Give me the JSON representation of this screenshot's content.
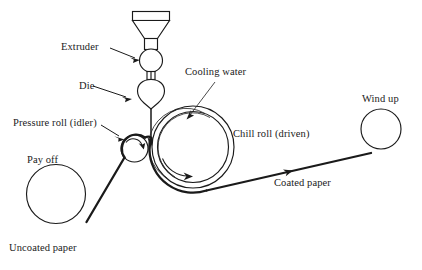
{
  "diagram": {
    "background_color": "#ffffff",
    "line_color": "#1a1a1a",
    "labels": {
      "extruder": "Extruder",
      "die": "Die",
      "pressure_roll": "Pressure roll (idler)",
      "pay_off": "Pay off",
      "uncoated_paper": "Uncoated paper",
      "cooling_water": "Cooling water",
      "chill_roll": "Chill roll (driven)",
      "coated_paper": "Coated paper",
      "wind_up": "Wind up"
    },
    "components": [
      {
        "name": "hopper",
        "shape": "funnel",
        "label": ""
      },
      {
        "name": "extruder-barrel",
        "shape": "circle",
        "label": "Extruder"
      },
      {
        "name": "die",
        "shape": "teardrop",
        "label": "Die"
      },
      {
        "name": "chill-roll",
        "shape": "concentric-circles",
        "label": "Chill roll (driven)",
        "rotation": "clockwise"
      },
      {
        "name": "pressure-roll",
        "shape": "circle",
        "label": "Pressure roll (idler)",
        "rotation": "clockwise"
      },
      {
        "name": "pay-off-roll",
        "shape": "circle",
        "label": "Pay off"
      },
      {
        "name": "wind-up-roll",
        "shape": "circle",
        "label": "Wind up"
      }
    ],
    "web_paths": [
      {
        "name": "uncoated-web",
        "from": "pay-off-roll",
        "to": "pressure-roll",
        "label": "Uncoated paper"
      },
      {
        "name": "coated-web",
        "from": "chill-roll",
        "to": "wind-up-roll",
        "label": "Coated paper",
        "direction": "right"
      }
    ]
  }
}
